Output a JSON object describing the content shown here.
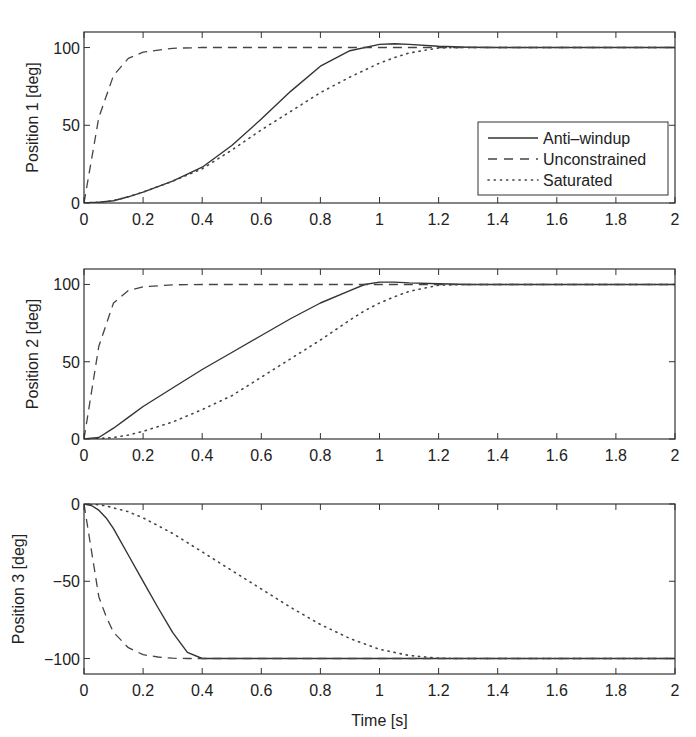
{
  "chart_data": [
    {
      "type": "line",
      "title": "",
      "xlabel": "",
      "ylabel": "Position  1 [deg]",
      "xlim": [
        0,
        2
      ],
      "ylim": [
        0,
        110
      ],
      "xticks": [
        "0",
        "0.2",
        "0.4",
        "0.6",
        "0.8",
        "1",
        "1.2",
        "1.4",
        "1.6",
        "1.8",
        "2"
      ],
      "yticks": [
        "0",
        "50",
        "100"
      ],
      "ytick_values": [
        0,
        50,
        100
      ],
      "grid": false,
      "legend_position": "lower right",
      "legend": [
        "Anti–windup",
        "Unconstrained",
        "Saturated"
      ],
      "x": [
        0,
        0.05,
        0.1,
        0.15,
        0.2,
        0.3,
        0.4,
        0.5,
        0.6,
        0.7,
        0.8,
        0.9,
        1.0,
        1.05,
        1.1,
        1.2,
        1.3,
        1.4,
        1.6,
        1.8,
        2.0
      ],
      "series": [
        {
          "name": "Anti–windup",
          "style": "solid",
          "values": [
            0,
            0.5,
            1.5,
            4,
            7,
            14,
            23,
            37,
            54,
            72,
            88,
            98,
            102,
            102.5,
            102,
            100.8,
            100.2,
            100,
            100,
            100,
            100
          ]
        },
        {
          "name": "Unconstrained",
          "style": "dashed",
          "values": [
            0,
            55,
            82,
            93,
            97,
            99.5,
            100,
            100,
            100,
            100,
            100,
            100,
            100,
            100,
            100,
            100,
            100,
            100,
            100,
            100,
            100
          ]
        },
        {
          "name": "Saturated",
          "style": "dotted",
          "values": [
            0,
            0.5,
            1.5,
            4,
            7,
            14,
            22,
            34,
            47,
            59,
            71,
            81,
            90,
            93.5,
            96.5,
            99.8,
            100,
            100,
            100,
            100,
            100
          ]
        }
      ]
    },
    {
      "type": "line",
      "title": "",
      "xlabel": "",
      "ylabel": "Position  2 [deg]",
      "xlim": [
        0,
        2
      ],
      "ylim": [
        0,
        110
      ],
      "xticks": [
        "0",
        "0.2",
        "0.4",
        "0.6",
        "0.8",
        "1",
        "1.2",
        "1.4",
        "1.6",
        "1.8",
        "2"
      ],
      "yticks": [
        "0",
        "50",
        "100"
      ],
      "ytick_values": [
        0,
        50,
        100
      ],
      "grid": false,
      "x": [
        0,
        0.05,
        0.1,
        0.15,
        0.2,
        0.3,
        0.4,
        0.5,
        0.6,
        0.7,
        0.8,
        0.9,
        0.95,
        1.0,
        1.05,
        1.1,
        1.2,
        1.3,
        1.4,
        1.6,
        1.8,
        2.0
      ],
      "series": [
        {
          "name": "Anti–windup",
          "style": "solid",
          "values": [
            0,
            1,
            7,
            14,
            21,
            33,
            45,
            56,
            67,
            78,
            88,
            96,
            100,
            101.5,
            101.5,
            101,
            100.5,
            100,
            100,
            100,
            100,
            100
          ]
        },
        {
          "name": "Unconstrained",
          "style": "dashed",
          "values": [
            0,
            60,
            88,
            96,
            98.5,
            99.8,
            100,
            100,
            100,
            100,
            100,
            100,
            100,
            100,
            100,
            100,
            100,
            100,
            100,
            100,
            100,
            100
          ]
        },
        {
          "name": "Saturated",
          "style": "dotted",
          "values": [
            0,
            0.3,
            1,
            2.5,
            5,
            11,
            19,
            28,
            40,
            52,
            64,
            77,
            83,
            88,
            92,
            95.5,
            99.5,
            100,
            100,
            100,
            100,
            100
          ]
        }
      ]
    },
    {
      "type": "line",
      "title": "",
      "xlabel": "Time [s]",
      "ylabel": "Position  3 [deg]",
      "xlim": [
        0,
        2
      ],
      "ylim": [
        -110,
        0
      ],
      "xticks": [
        "0",
        "0.2",
        "0.4",
        "0.6",
        "0.8",
        "1",
        "1.2",
        "1.4",
        "1.6",
        "1.8",
        "2"
      ],
      "yticks": [
        "−100",
        "−50",
        "0"
      ],
      "ytick_values": [
        -100,
        -50,
        0
      ],
      "grid": false,
      "x": [
        0,
        0.025,
        0.05,
        0.075,
        0.1,
        0.15,
        0.2,
        0.25,
        0.3,
        0.35,
        0.4,
        0.5,
        0.6,
        0.7,
        0.8,
        0.9,
        1.0,
        1.1,
        1.2,
        1.25,
        1.4,
        1.6,
        1.8,
        2.0
      ],
      "series": [
        {
          "name": "Anti–windup",
          "style": "solid",
          "values": [
            0,
            -1,
            -4,
            -9,
            -16,
            -33,
            -50,
            -67,
            -83,
            -96,
            -100,
            -100,
            -100,
            -100,
            -100,
            -100,
            -100,
            -100,
            -100,
            -100,
            -100,
            -100,
            -100,
            -100
          ]
        },
        {
          "name": "Unconstrained",
          "style": "dashed",
          "values": [
            0,
            -30,
            -60,
            -73,
            -83,
            -93,
            -97.5,
            -99,
            -99.8,
            -100,
            -100,
            -100,
            -100,
            -100,
            -100,
            -100,
            -100,
            -100,
            -100,
            -100,
            -100,
            -100,
            -100,
            -100
          ]
        },
        {
          "name": "Saturated",
          "style": "dotted",
          "values": [
            0,
            0,
            -0.5,
            -1.2,
            -2.5,
            -5,
            -9,
            -14,
            -19,
            -25,
            -31,
            -43,
            -55,
            -67,
            -78,
            -87,
            -94,
            -98,
            -99.8,
            -100,
            -100,
            -100,
            -100,
            -100
          ]
        }
      ]
    }
  ]
}
